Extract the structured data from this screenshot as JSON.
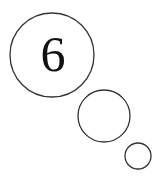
{
  "thought_bubble": {
    "main_label": "6",
    "stroke_color": "#333333",
    "circles": [
      {
        "name": "large-bubble",
        "cx": 52,
        "cy": 55,
        "r": 42
      },
      {
        "name": "medium-bubble",
        "cx": 104,
        "cy": 116,
        "r": 26
      },
      {
        "name": "small-bubble",
        "cx": 138,
        "cy": 156,
        "r": 13
      }
    ]
  }
}
